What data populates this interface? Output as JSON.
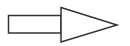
{
  "diagram": {
    "shape": "right-arrow",
    "stroke_color": "#333333",
    "fill_color": "#ffffff",
    "stroke_width": 1.5,
    "shaft": {
      "x": 8.5,
      "y": 15.5,
      "width": 52.5,
      "height": 17.5
    },
    "head": {
      "points": "61,7.5 117,25 61,42"
    }
  }
}
